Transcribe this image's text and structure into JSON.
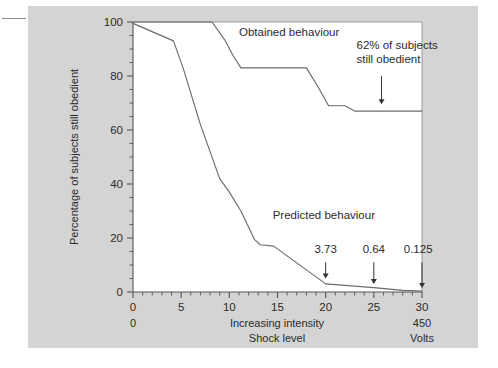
{
  "figure": {
    "background_color": "#ffffff",
    "panel_color": "#d4d4d4",
    "plot_background": "#ffffff",
    "line_color": "#6b6b6b",
    "text_color": "#2b2b2b"
  },
  "chart_data": {
    "type": "line",
    "title": "",
    "xlabel": "Increasing intensity",
    "xlabel2": "Shock level",
    "ylabel": "Percentage of subjects still obedient",
    "xlim": [
      0,
      30
    ],
    "ylim": [
      0,
      100
    ],
    "xticks": [
      0,
      5,
      10,
      15,
      20,
      25,
      30
    ],
    "xtick_labels": [
      "0",
      "5",
      "10",
      "15",
      "20",
      "25",
      "30"
    ],
    "yticks": [
      0,
      20,
      40,
      60,
      80,
      100
    ],
    "ytick_labels": [
      "0",
      "20",
      "40",
      "60",
      "80",
      "100"
    ],
    "minor_xtick_step": 1,
    "minor_ytick_step": 5,
    "grid": false,
    "legend_position": "inline-labels",
    "axis_left_label": "0",
    "axis_right_label_top": "450",
    "axis_right_label_bottom": "Volts",
    "series": [
      {
        "name": "Obtained behaviour",
        "label": "Obtained behaviour",
        "label_x": 11.0,
        "label_y": 95.0,
        "x": [
          0,
          8.2,
          9.5,
          10.4,
          11.2,
          18.0,
          19.2,
          20.3,
          22.0,
          23.0,
          30.0
        ],
        "values": [
          100,
          100,
          93.5,
          87.5,
          83.0,
          83.0,
          76.0,
          69.0,
          69.0,
          67.0,
          67.0
        ]
      },
      {
        "name": "Predicted behaviour",
        "label": "Predicted behaviour",
        "label_x": 14.5,
        "label_y": 27.0,
        "x": [
          0,
          4.2,
          5.2,
          7.0,
          9.0,
          10.0,
          11.2,
          12.6,
          13.2,
          14.6,
          20.0,
          25.0,
          28.0,
          30.0
        ],
        "values": [
          99.5,
          93.0,
          83.0,
          62.0,
          42.0,
          37.0,
          30.0,
          19.5,
          17.5,
          17.0,
          3.0,
          1.6,
          0.6,
          0.3
        ]
      }
    ],
    "annotations": [
      {
        "id": "obtained-final-annotation",
        "text_line1": "62% of subjects",
        "text_line2": "still obedient",
        "text_x": 23.2,
        "text_y": 90.0,
        "arrow_x": 25.8,
        "arrow_y_from": 80.0,
        "arrow_y_to": 69.5
      },
      {
        "id": "predicted-value-20",
        "text": "3.73",
        "text_x": 20.0,
        "text_y": 14.5,
        "arrow_x": 20.0,
        "arrow_y_from": 11.0,
        "arrow_y_to": 5.0
      },
      {
        "id": "predicted-value-25",
        "text": "0.64",
        "text_x": 25.0,
        "text_y": 14.5,
        "arrow_x": 25.0,
        "arrow_y_from": 11.0,
        "arrow_y_to": 3.0
      },
      {
        "id": "predicted-value-30",
        "text": "0.125",
        "text_x": 29.6,
        "text_y": 14.5,
        "arrow_x": 30.0,
        "arrow_y_from": 11.0,
        "arrow_y_to": 1.5
      }
    ]
  }
}
